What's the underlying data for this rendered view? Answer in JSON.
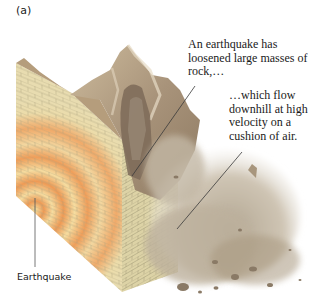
{
  "figure": {
    "panel_label": "(a)",
    "callouts": [
      {
        "id": "loosened-rock",
        "text": "An earthquake has loosened large masses of rock,…"
      },
      {
        "id": "flow-downhill",
        "text": "…which flow downhill at high velocity on a cushion of air."
      }
    ],
    "labels": {
      "earthquake": "Earthquake"
    },
    "colors": {
      "rock_face": "#e8dcb0",
      "brick_lines": "#a8a27a",
      "seismic_orange": "#ee9a55",
      "mountain": "#b8a58a",
      "mountain_dark": "#7e6a52",
      "debris_cloud": "#c9bfae",
      "leader_line": "#3a3a3a"
    }
  }
}
